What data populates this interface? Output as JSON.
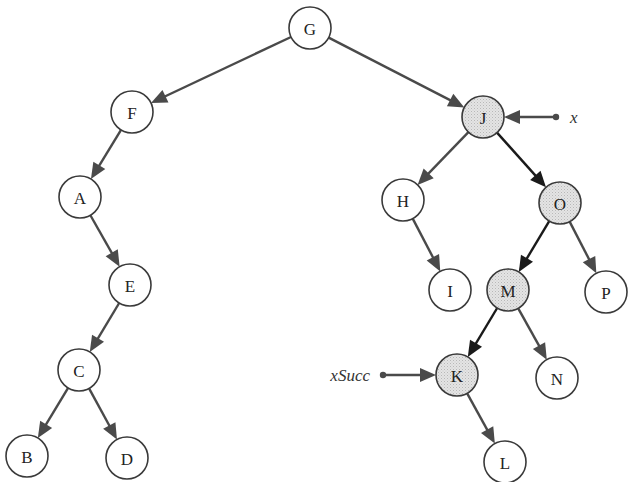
{
  "diagram": {
    "type": "binary-search-tree",
    "node_radius": 21,
    "colors": {
      "node_fill": "#ffffff",
      "highlight_fill": "#e2e2e2",
      "edge": "#4a4a4a",
      "highlight_edge": "#1a1a1a",
      "stroke": "#3a3a3a"
    },
    "nodes": [
      {
        "id": "G",
        "label": "G",
        "x": 310,
        "y": 28,
        "highlighted": false
      },
      {
        "id": "F",
        "label": "F",
        "x": 132,
        "y": 112,
        "highlighted": false
      },
      {
        "id": "J",
        "label": "J",
        "x": 483,
        "y": 117,
        "highlighted": true
      },
      {
        "id": "A",
        "label": "A",
        "x": 80,
        "y": 197,
        "highlighted": false
      },
      {
        "id": "H",
        "label": "H",
        "x": 403,
        "y": 200,
        "highlighted": false
      },
      {
        "id": "O",
        "label": "O",
        "x": 560,
        "y": 203,
        "highlighted": true
      },
      {
        "id": "E",
        "label": "E",
        "x": 130,
        "y": 285,
        "highlighted": false
      },
      {
        "id": "I",
        "label": "I",
        "x": 450,
        "y": 290,
        "highlighted": false
      },
      {
        "id": "M",
        "label": "M",
        "x": 508,
        "y": 290,
        "highlighted": true
      },
      {
        "id": "P",
        "label": "P",
        "x": 606,
        "y": 292,
        "highlighted": false
      },
      {
        "id": "C",
        "label": "C",
        "x": 79,
        "y": 370,
        "highlighted": false
      },
      {
        "id": "K",
        "label": "K",
        "x": 457,
        "y": 375,
        "highlighted": true
      },
      {
        "id": "N",
        "label": "N",
        "x": 557,
        "y": 378,
        "highlighted": false
      },
      {
        "id": "B",
        "label": "B",
        "x": 27,
        "y": 456,
        "highlighted": false
      },
      {
        "id": "D",
        "label": "D",
        "x": 127,
        "y": 458,
        "highlighted": false
      },
      {
        "id": "L",
        "label": "L",
        "x": 505,
        "y": 462,
        "highlighted": false
      }
    ],
    "edges": [
      {
        "from": "G",
        "to": "F",
        "highlighted": false
      },
      {
        "from": "G",
        "to": "J",
        "highlighted": false
      },
      {
        "from": "F",
        "to": "A",
        "highlighted": false
      },
      {
        "from": "A",
        "to": "E",
        "highlighted": false
      },
      {
        "from": "E",
        "to": "C",
        "highlighted": false
      },
      {
        "from": "C",
        "to": "B",
        "highlighted": false
      },
      {
        "from": "C",
        "to": "D",
        "highlighted": false
      },
      {
        "from": "J",
        "to": "H",
        "highlighted": false
      },
      {
        "from": "J",
        "to": "O",
        "highlighted": true
      },
      {
        "from": "H",
        "to": "I",
        "highlighted": false
      },
      {
        "from": "O",
        "to": "M",
        "highlighted": true
      },
      {
        "from": "O",
        "to": "P",
        "highlighted": false
      },
      {
        "from": "M",
        "to": "K",
        "highlighted": true
      },
      {
        "from": "M",
        "to": "N",
        "highlighted": false
      },
      {
        "from": "K",
        "to": "L",
        "highlighted": false
      }
    ],
    "pointers": [
      {
        "label": "x",
        "target": "J",
        "dot_x": 556,
        "dot_y": 117,
        "label_x": 570,
        "label_y": 117,
        "label_anchor": "start"
      },
      {
        "label": "xSucc",
        "target": "K",
        "dot_x": 383,
        "dot_y": 375,
        "label_x": 370,
        "label_y": 375,
        "label_anchor": "end"
      }
    ]
  }
}
